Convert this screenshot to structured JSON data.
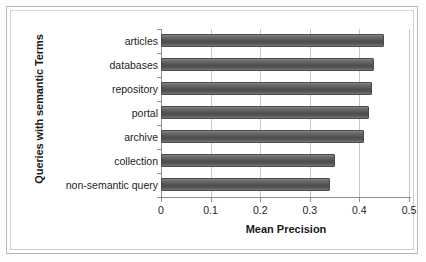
{
  "chart_data": {
    "type": "bar",
    "orientation": "horizontal",
    "title": "",
    "xlabel": "Mean Precision",
    "ylabel": "Queries with semantic Terms",
    "categories": [
      "articles",
      "databases",
      "repository",
      "portal",
      "archive",
      "collection",
      "non-semantic query"
    ],
    "values": [
      0.45,
      0.43,
      0.425,
      0.42,
      0.41,
      0.35,
      0.34
    ],
    "xlim": [
      0,
      0.5
    ],
    "xticks": [
      "0",
      "0.1",
      "0.2",
      "0.3",
      "0.4",
      "0.5"
    ],
    "xtick_values": [
      0,
      0.1,
      0.2,
      0.3,
      0.4,
      0.5
    ],
    "grid": "vertical",
    "legend": "none",
    "series": [
      {
        "name": "Mean Precision",
        "values": [
          0.45,
          0.43,
          0.425,
          0.42,
          0.41,
          0.35,
          0.34
        ]
      }
    ],
    "colors": {
      "bar_fill": "#565656",
      "bar_border": "#4a4a4a",
      "gridline": "#c6c6c6",
      "axis": "#8e8e8e",
      "text": "#1d1d1d",
      "background": "#ffffff"
    }
  }
}
